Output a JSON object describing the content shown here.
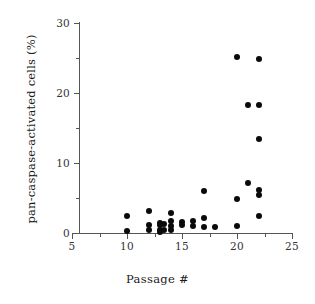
{
  "chart_data": {
    "type": "scatter",
    "title": "",
    "xlabel": "Passage #",
    "ylabel": "pan-caspase-activated cells (%)",
    "xlim": [
      5,
      25
    ],
    "ylim": [
      0,
      30
    ],
    "xticks": [
      5,
      10,
      15,
      20,
      25
    ],
    "xtick_labels": [
      "5",
      "10",
      "15",
      "20",
      "25"
    ],
    "xticks_minor": [
      7.5,
      12.5,
      17.5,
      22.5
    ],
    "yticks": [
      0,
      10,
      20,
      30
    ],
    "ytick_labels": [
      "0",
      "10",
      "20",
      "30"
    ],
    "yticks_minor": [
      5,
      15,
      25
    ],
    "grid": false,
    "legend": null,
    "marker": "filled-circle",
    "marker_color": "#0a0a0a",
    "axis_color": "#555555",
    "background": "#ffffff",
    "series": [
      {
        "name": "pan-caspase-activated cells",
        "points": [
          {
            "x": 10,
            "y": 2.5
          },
          {
            "x": 10,
            "y": 0.3
          },
          {
            "x": 12,
            "y": 3.2
          },
          {
            "x": 12,
            "y": 1.2
          },
          {
            "x": 12,
            "y": 0.4
          },
          {
            "x": 13,
            "y": 1.5
          },
          {
            "x": 13,
            "y": 1.1
          },
          {
            "x": 13,
            "y": 0.5
          },
          {
            "x": 13,
            "y": 0.2
          },
          {
            "x": 13.4,
            "y": 1.3
          },
          {
            "x": 13.4,
            "y": 0.4
          },
          {
            "x": 14,
            "y": 2.8
          },
          {
            "x": 14,
            "y": 1.7
          },
          {
            "x": 14,
            "y": 1.0
          },
          {
            "x": 14,
            "y": 0.4
          },
          {
            "x": 15,
            "y": 1.6
          },
          {
            "x": 15,
            "y": 1.2
          },
          {
            "x": 16,
            "y": 1.7
          },
          {
            "x": 16,
            "y": 1.0
          },
          {
            "x": 17,
            "y": 6.0
          },
          {
            "x": 17,
            "y": 2.1
          },
          {
            "x": 17,
            "y": 0.9
          },
          {
            "x": 18,
            "y": 0.9
          },
          {
            "x": 20,
            "y": 25.2
          },
          {
            "x": 20,
            "y": 4.8
          },
          {
            "x": 20,
            "y": 1.0
          },
          {
            "x": 21,
            "y": 18.3
          },
          {
            "x": 21,
            "y": 7.2
          },
          {
            "x": 22,
            "y": 24.9
          },
          {
            "x": 22,
            "y": 18.3
          },
          {
            "x": 22,
            "y": 13.5
          },
          {
            "x": 22,
            "y": 6.2
          },
          {
            "x": 22,
            "y": 5.5
          },
          {
            "x": 22,
            "y": 2.4
          }
        ]
      }
    ]
  }
}
